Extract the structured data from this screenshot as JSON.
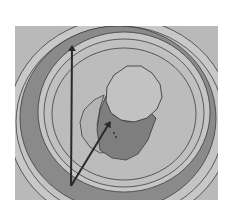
{
  "figure": {
    "type": "3d-cad-render",
    "colors": {
      "background": "#ffffff",
      "viewport": "#b9b9b9",
      "outer_rim": "#c8c8c8",
      "pocket_wall": "#8a8a8a",
      "pocket_floor": "#bcbcbc",
      "inner_ring": "#c6c6c6",
      "boss_top": "#c2c2c2",
      "boss_side": "#7e7e7e",
      "edge_line": "#3c3c3c",
      "arrow": "#2a2a2a"
    },
    "viewport": {
      "x": 15,
      "y": 26,
      "width": 203,
      "height": 174
    },
    "vectors": [
      {
        "name": "vertical-vector",
        "from": [
          71,
          186
        ],
        "to": [
          72,
          45
        ]
      },
      {
        "name": "diagonal-vector",
        "from": [
          71,
          186
        ],
        "to": [
          111,
          121
        ]
      }
    ],
    "boss": {
      "cx": 134,
      "cy": 93,
      "r": 28
    }
  }
}
